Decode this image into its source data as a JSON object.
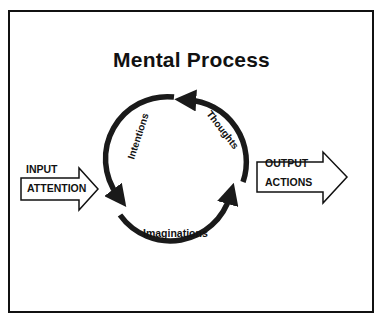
{
  "diagram": {
    "title": "Mental Process",
    "cycle": [
      {
        "label": "Intentions",
        "segment": "left",
        "direction": "counterclockwise"
      },
      {
        "label": "Imaginations",
        "segment": "bottom",
        "direction": "counterclockwise"
      },
      {
        "label": "Thoughts",
        "segment": "right",
        "direction": "counterclockwise"
      }
    ],
    "input": {
      "top_label": "INPUT",
      "box_label": "ATTENTION"
    },
    "output": {
      "top_label": "OUTPUT",
      "box_label": "ACTIONS"
    },
    "colors": {
      "stroke": "#111111",
      "arrow_fill": "#1a1a1a",
      "background": "#ffffff"
    }
  }
}
